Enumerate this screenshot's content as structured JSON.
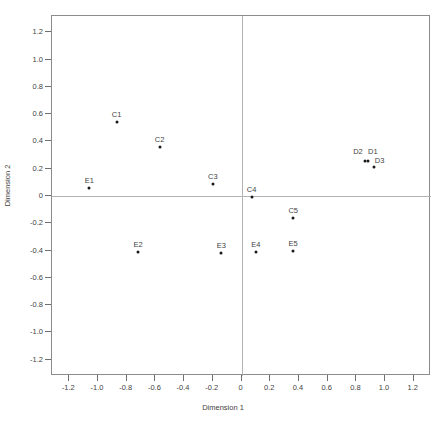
{
  "chart_data": {
    "type": "scatter",
    "title": "",
    "xlabel": "Dimension 1",
    "ylabel": "Dimension 2",
    "xlim": [
      -1.32,
      1.32
    ],
    "ylim": [
      -1.32,
      1.32
    ],
    "grid": false,
    "legend": null,
    "xticks": [
      "-1.2",
      "-1.0",
      "-0.8",
      "-0.6",
      "-0.4",
      "-0.2",
      "0",
      "0.2",
      "0.4",
      "0.6",
      "0.8",
      "1.0",
      "1.2"
    ],
    "xtickvalues": [
      -1.2,
      -1.0,
      -0.8,
      -0.6,
      -0.4,
      -0.2,
      0,
      0.2,
      0.4,
      0.6,
      0.8,
      1.0,
      1.2
    ],
    "yticks": [
      "1.2",
      "1.0",
      "0.8",
      "0.6",
      "0.4",
      "0.2",
      "0",
      "-0.2",
      "-0.4",
      "-0.6",
      "-0.8",
      "-1.0",
      "-1.2"
    ],
    "ytickvalues": [
      1.2,
      1.0,
      0.8,
      0.6,
      0.4,
      0.2,
      0,
      -0.2,
      -0.4,
      -0.6,
      -0.8,
      -1.0,
      -1.2
    ],
    "points": [
      {
        "label": "C1",
        "x": -0.87,
        "y": 0.54
      },
      {
        "label": "C2",
        "x": -0.57,
        "y": 0.36
      },
      {
        "label": "C3",
        "x": -0.2,
        "y": 0.09
      },
      {
        "label": "C4",
        "x": 0.07,
        "y": -0.01
      },
      {
        "label": "C5",
        "x": 0.36,
        "y": -0.16
      },
      {
        "label": "D1",
        "x": 0.88,
        "y": 0.26
      },
      {
        "label": "D2",
        "x": 0.86,
        "y": 0.26
      },
      {
        "label": "D3",
        "x": 0.92,
        "y": 0.21
      },
      {
        "label": "E1",
        "x": -1.06,
        "y": 0.06
      },
      {
        "label": "E2",
        "x": -0.72,
        "y": -0.41
      },
      {
        "label": "E3",
        "x": -0.14,
        "y": -0.42
      },
      {
        "label": "E4",
        "x": 0.1,
        "y": -0.41
      },
      {
        "label": "E5",
        "x": 0.36,
        "y": -0.4
      }
    ],
    "label_offsets": {
      "D1": {
        "dx": 5,
        "dy": -2
      },
      "D2": {
        "dx": -7,
        "dy": -2
      },
      "D3": {
        "dx": 6,
        "dy": 1
      }
    },
    "colors": {
      "point": "#1a1a1a",
      "frame": "#8c8c8c",
      "zero_line": "#b3b3b3",
      "text": "#3f3f3f",
      "background": "#ffffff"
    }
  }
}
